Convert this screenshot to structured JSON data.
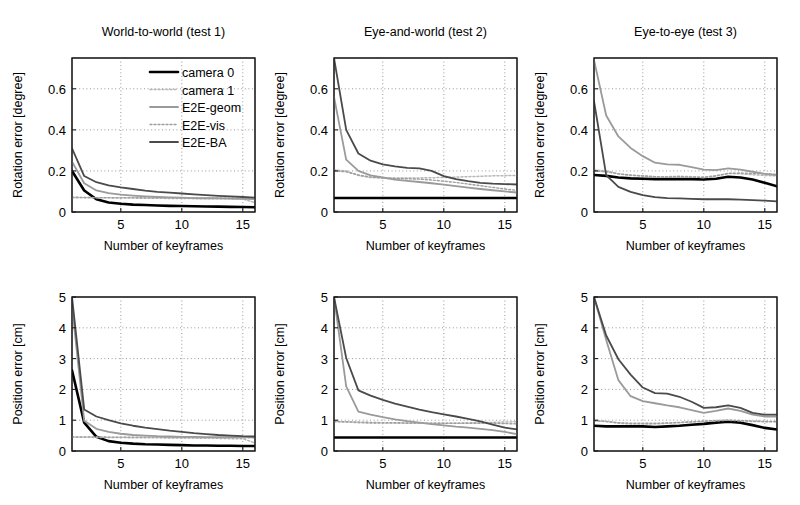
{
  "figure": {
    "title": "",
    "background": "#ffffff",
    "rows": 2,
    "cols": 3
  },
  "series_styles": [
    {
      "name": "camera 0",
      "color": "#000000",
      "width": 2.6,
      "dash": "none"
    },
    {
      "name": "camera 1",
      "color": "#b8b8b8",
      "width": 1.5,
      "dash": "2 2"
    },
    {
      "name": "E2E-geom",
      "color": "#9a9a9a",
      "width": 1.8,
      "dash": "none"
    },
    {
      "name": "E2E-vis",
      "color": "#9e9e9e",
      "width": 1.4,
      "dash": "2 2"
    },
    {
      "name": "E2E-BA",
      "color": "#4a4a4a",
      "width": 1.8,
      "dash": "none"
    }
  ],
  "legend": {
    "visible_in_panel": 0,
    "entries": [
      {
        "label": "camera 0"
      },
      {
        "label": "camera 1"
      },
      {
        "label": "E2E-geom"
      },
      {
        "label": "E2E-vis"
      },
      {
        "label": "E2E-BA"
      }
    ]
  },
  "chart_data": [
    {
      "id": "rotation-test1",
      "type": "line",
      "title": "World-to-world (test 1)",
      "xlabel": "Number of keyframes",
      "ylabel": "Rotation error [degree]",
      "xlim": [
        1,
        16
      ],
      "ylim": [
        0,
        0.75
      ],
      "xticks": [
        5,
        10,
        15
      ],
      "yticks": [
        0,
        0.2,
        0.4,
        0.6
      ],
      "xticklabels": [
        "5",
        "10",
        "15"
      ],
      "yticklabels": [
        "0",
        "0.2",
        "0.4",
        "0.6"
      ],
      "grid": true,
      "legend": true,
      "x": [
        1,
        2,
        3,
        4,
        5,
        6,
        7,
        8,
        9,
        10,
        11,
        12,
        13,
        14,
        15,
        16
      ],
      "series": [
        {
          "name": "camera 0",
          "values": [
            0.2,
            0.105,
            0.062,
            0.046,
            0.04,
            0.036,
            0.034,
            0.032,
            0.03,
            0.029,
            0.028,
            0.027,
            0.026,
            0.025,
            0.024,
            0.023
          ]
        },
        {
          "name": "camera 1",
          "values": [
            0.07,
            0.07,
            0.069,
            0.069,
            0.068,
            0.068,
            0.067,
            0.067,
            0.066,
            0.066,
            0.065,
            0.065,
            0.064,
            0.064,
            0.063,
            0.046
          ]
        },
        {
          "name": "E2E-geom",
          "values": [
            0.245,
            0.14,
            0.105,
            0.092,
            0.085,
            0.08,
            0.076,
            0.073,
            0.071,
            0.07,
            0.068,
            0.067,
            0.066,
            0.065,
            0.064,
            0.063
          ]
        },
        {
          "name": "E2E-vis",
          "values": [
            0.072,
            0.071,
            0.07,
            0.07,
            0.07,
            0.07,
            0.069,
            0.069,
            0.069,
            0.069,
            0.068,
            0.068,
            0.068,
            0.068,
            0.067,
            0.067
          ]
        },
        {
          "name": "E2E-BA",
          "values": [
            0.31,
            0.175,
            0.145,
            0.13,
            0.12,
            0.112,
            0.104,
            0.098,
            0.094,
            0.09,
            0.086,
            0.082,
            0.079,
            0.076,
            0.073,
            0.07
          ]
        }
      ]
    },
    {
      "id": "rotation-test2",
      "type": "line",
      "title": "Eye-and-world (test 2)",
      "xlabel": "Number of keyframes",
      "ylabel": "Rotation error [degree]",
      "xlim": [
        1,
        16
      ],
      "ylim": [
        0,
        0.75
      ],
      "xticks": [
        5,
        10,
        15
      ],
      "yticks": [
        0,
        0.2,
        0.4,
        0.6
      ],
      "xticklabels": [
        "5",
        "10",
        "15"
      ],
      "yticklabels": [
        "0",
        "0.2",
        "0.4",
        "0.6"
      ],
      "grid": true,
      "legend": false,
      "x": [
        1,
        2,
        3,
        4,
        5,
        6,
        7,
        8,
        9,
        10,
        11,
        12,
        13,
        14,
        15,
        16
      ],
      "series": [
        {
          "name": "camera 0",
          "values": [
            0.068,
            0.068,
            0.068,
            0.068,
            0.068,
            0.068,
            0.068,
            0.068,
            0.068,
            0.068,
            0.068,
            0.068,
            0.068,
            0.068,
            0.068,
            0.068
          ]
        },
        {
          "name": "camera 1",
          "values": [
            0.205,
            0.2,
            0.178,
            0.168,
            0.166,
            0.165,
            0.165,
            0.166,
            0.167,
            0.168,
            0.17,
            0.172,
            0.174,
            0.176,
            0.177,
            0.178
          ]
        },
        {
          "name": "E2E-geom",
          "values": [
            0.56,
            0.255,
            0.2,
            0.178,
            0.168,
            0.158,
            0.152,
            0.146,
            0.14,
            0.133,
            0.126,
            0.119,
            0.112,
            0.106,
            0.1,
            0.095
          ]
        },
        {
          "name": "E2E-vis",
          "values": [
            0.2,
            0.196,
            0.18,
            0.17,
            0.166,
            0.164,
            0.162,
            0.16,
            0.156,
            0.15,
            0.144,
            0.136,
            0.128,
            0.12,
            0.112,
            0.105
          ]
        },
        {
          "name": "E2E-BA",
          "values": [
            0.75,
            0.4,
            0.285,
            0.25,
            0.232,
            0.222,
            0.215,
            0.212,
            0.2,
            0.175,
            0.16,
            0.15,
            0.142,
            0.138,
            0.136,
            0.134
          ]
        }
      ]
    },
    {
      "id": "rotation-test3",
      "type": "line",
      "title": "Eye-to-eye (test 3)",
      "xlabel": "Number of keyframes",
      "ylabel": "Rotation error [degree]",
      "xlim": [
        1,
        16
      ],
      "ylim": [
        0,
        0.75
      ],
      "xticks": [
        5,
        10,
        15
      ],
      "yticks": [
        0,
        0.2,
        0.4,
        0.6
      ],
      "xticklabels": [
        "5",
        "10",
        "15"
      ],
      "yticklabels": [
        "0",
        "0.2",
        "0.4",
        "0.6"
      ],
      "grid": true,
      "legend": false,
      "x": [
        1,
        2,
        3,
        4,
        5,
        6,
        7,
        8,
        9,
        10,
        11,
        12,
        13,
        14,
        15,
        16
      ],
      "series": [
        {
          "name": "camera 0",
          "values": [
            0.18,
            0.176,
            0.168,
            0.164,
            0.162,
            0.16,
            0.16,
            0.161,
            0.16,
            0.158,
            0.162,
            0.172,
            0.168,
            0.158,
            0.142,
            0.125
          ]
        },
        {
          "name": "camera 1",
          "values": [
            0.205,
            0.2,
            0.186,
            0.178,
            0.175,
            0.172,
            0.172,
            0.174,
            0.172,
            0.17,
            0.176,
            0.188,
            0.186,
            0.182,
            0.178,
            0.176
          ]
        },
        {
          "name": "E2E-geom",
          "values": [
            0.74,
            0.47,
            0.368,
            0.312,
            0.272,
            0.24,
            0.232,
            0.23,
            0.218,
            0.206,
            0.204,
            0.212,
            0.206,
            0.196,
            0.186,
            0.18
          ]
        },
        {
          "name": "E2E-vis",
          "values": [
            0.2,
            0.196,
            0.186,
            0.18,
            0.176,
            0.172,
            0.17,
            0.172,
            0.17,
            0.168,
            0.176,
            0.188,
            0.19,
            0.188,
            0.186,
            0.184
          ]
        },
        {
          "name": "E2E-BA",
          "values": [
            0.54,
            0.18,
            0.122,
            0.098,
            0.082,
            0.072,
            0.068,
            0.066,
            0.064,
            0.062,
            0.062,
            0.062,
            0.06,
            0.058,
            0.055,
            0.052
          ]
        }
      ]
    },
    {
      "id": "position-test1",
      "type": "line",
      "title": "",
      "xlabel": "Number of keyframes",
      "ylabel": "Position error [cm]",
      "xlim": [
        1,
        16
      ],
      "ylim": [
        0,
        5
      ],
      "xticks": [
        5,
        10,
        15
      ],
      "yticks": [
        0,
        1,
        2,
        3,
        4,
        5
      ],
      "xticklabels": [
        "5",
        "10",
        "15"
      ],
      "yticklabels": [
        "0",
        "1",
        "2",
        "3",
        "4",
        "5"
      ],
      "grid": true,
      "legend": false,
      "x": [
        1,
        2,
        3,
        4,
        5,
        6,
        7,
        8,
        9,
        10,
        11,
        12,
        13,
        14,
        15,
        16
      ],
      "series": [
        {
          "name": "camera 0",
          "values": [
            2.62,
            0.92,
            0.46,
            0.32,
            0.27,
            0.24,
            0.22,
            0.21,
            0.2,
            0.19,
            0.18,
            0.18,
            0.17,
            0.17,
            0.16,
            0.16
          ]
        },
        {
          "name": "camera 1",
          "values": [
            0.45,
            0.45,
            0.44,
            0.44,
            0.44,
            0.43,
            0.43,
            0.43,
            0.42,
            0.42,
            0.42,
            0.41,
            0.41,
            0.4,
            0.4,
            0.26
          ]
        },
        {
          "name": "E2E-geom",
          "values": [
            4.72,
            0.98,
            0.72,
            0.62,
            0.56,
            0.52,
            0.5,
            0.48,
            0.47,
            0.46,
            0.46,
            0.45,
            0.45,
            0.45,
            0.45,
            0.45
          ]
        },
        {
          "name": "E2E-vis",
          "values": [
            0.46,
            0.46,
            0.46,
            0.45,
            0.45,
            0.45,
            0.45,
            0.45,
            0.44,
            0.44,
            0.44,
            0.44,
            0.43,
            0.43,
            0.43,
            0.43
          ]
        },
        {
          "name": "E2E-BA",
          "values": [
            5.0,
            1.35,
            1.12,
            1.0,
            0.9,
            0.82,
            0.76,
            0.71,
            0.66,
            0.62,
            0.58,
            0.55,
            0.52,
            0.5,
            0.48,
            0.47
          ]
        }
      ]
    },
    {
      "id": "position-test2",
      "type": "line",
      "title": "",
      "xlabel": "Number of keyframes",
      "ylabel": "Position error [cm]",
      "xlim": [
        1,
        16
      ],
      "ylim": [
        0,
        5
      ],
      "xticks": [
        5,
        10,
        15
      ],
      "yticks": [
        0,
        1,
        2,
        3,
        4,
        5
      ],
      "xticklabels": [
        "5",
        "10",
        "15"
      ],
      "yticklabels": [
        "0",
        "1",
        "2",
        "3",
        "4",
        "5"
      ],
      "grid": true,
      "legend": false,
      "x": [
        1,
        2,
        3,
        4,
        5,
        6,
        7,
        8,
        9,
        10,
        11,
        12,
        13,
        14,
        15,
        16
      ],
      "series": [
        {
          "name": "camera 0",
          "values": [
            0.44,
            0.44,
            0.44,
            0.44,
            0.44,
            0.44,
            0.44,
            0.44,
            0.44,
            0.44,
            0.44,
            0.44,
            0.44,
            0.44,
            0.44,
            0.44
          ]
        },
        {
          "name": "camera 1",
          "values": [
            0.95,
            0.94,
            0.92,
            0.9,
            0.9,
            0.9,
            0.9,
            0.9,
            0.9,
            0.9,
            0.9,
            0.91,
            0.92,
            0.93,
            0.94,
            0.95
          ]
        },
        {
          "name": "E2E-geom",
          "values": [
            5.0,
            2.1,
            1.28,
            1.18,
            1.1,
            1.03,
            0.97,
            0.92,
            0.87,
            0.83,
            0.79,
            0.76,
            0.72,
            0.68,
            0.62,
            0.55
          ]
        },
        {
          "name": "E2E-vis",
          "values": [
            0.96,
            0.95,
            0.94,
            0.93,
            0.92,
            0.92,
            0.91,
            0.91,
            0.9,
            0.9,
            0.9,
            0.9,
            0.9,
            0.9,
            0.89,
            0.88
          ]
        },
        {
          "name": "E2E-BA",
          "values": [
            5.0,
            3.02,
            1.97,
            1.8,
            1.66,
            1.54,
            1.44,
            1.34,
            1.26,
            1.19,
            1.12,
            1.04,
            0.96,
            0.86,
            0.76,
            0.7
          ]
        }
      ]
    },
    {
      "id": "position-test3",
      "type": "line",
      "title": "",
      "xlabel": "Number of keyframes",
      "ylabel": "Position error [cm]",
      "xlim": [
        1,
        16
      ],
      "ylim": [
        0,
        5
      ],
      "xticks": [
        5,
        10,
        15
      ],
      "yticks": [
        0,
        1,
        2,
        3,
        4,
        5
      ],
      "xticklabels": [
        "5",
        "10",
        "15"
      ],
      "yticklabels": [
        "0",
        "1",
        "2",
        "3",
        "4",
        "5"
      ],
      "grid": true,
      "legend": false,
      "x": [
        1,
        2,
        3,
        4,
        5,
        6,
        7,
        8,
        9,
        10,
        11,
        12,
        13,
        14,
        15,
        16
      ],
      "series": [
        {
          "name": "camera 0",
          "values": [
            0.82,
            0.8,
            0.8,
            0.8,
            0.8,
            0.78,
            0.8,
            0.82,
            0.85,
            0.88,
            0.92,
            0.95,
            0.92,
            0.84,
            0.75,
            0.7
          ]
        },
        {
          "name": "camera 1",
          "values": [
            0.98,
            0.96,
            0.9,
            0.88,
            0.88,
            0.88,
            0.9,
            0.92,
            0.94,
            0.96,
            0.98,
            1.0,
            0.98,
            0.96,
            0.95,
            0.95
          ]
        },
        {
          "name": "E2E-geom",
          "values": [
            5.0,
            3.6,
            2.3,
            1.78,
            1.62,
            1.55,
            1.48,
            1.42,
            1.33,
            1.24,
            1.3,
            1.38,
            1.3,
            1.18,
            1.12,
            1.12
          ]
        },
        {
          "name": "E2E-vis",
          "values": [
            0.98,
            0.96,
            0.92,
            0.9,
            0.9,
            0.9,
            0.91,
            0.93,
            0.95,
            0.97,
            0.99,
            1.0,
            0.99,
            0.97,
            0.96,
            0.96
          ]
        },
        {
          "name": "E2E-BA",
          "values": [
            5.0,
            3.75,
            2.98,
            2.48,
            2.06,
            1.88,
            1.86,
            1.76,
            1.6,
            1.4,
            1.42,
            1.48,
            1.4,
            1.24,
            1.18,
            1.18
          ]
        }
      ]
    }
  ]
}
